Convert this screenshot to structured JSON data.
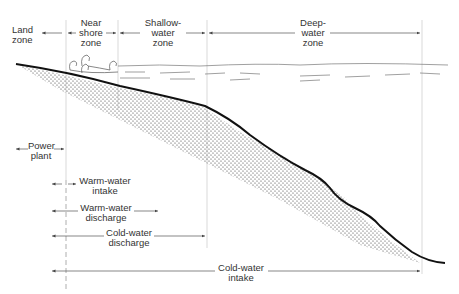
{
  "zones": {
    "land": {
      "line1": "Land",
      "line2": "zone"
    },
    "nearshore": {
      "line1": "Near",
      "line2": "shore",
      "line3": "zone"
    },
    "shallow": {
      "line1": "Shallow-",
      "line2": "water",
      "line3": "zone"
    },
    "deep": {
      "line1": "Deep-",
      "line2": "water",
      "line3": "zone"
    }
  },
  "ranges": {
    "power_plant": {
      "line1": "Power",
      "line2": "plant"
    },
    "warm_intake": {
      "line1": "Warm-water",
      "line2": "intake"
    },
    "warm_discharge": {
      "line1": "Warm-water",
      "line2": "discharge"
    },
    "cold_discharge": {
      "line1": "Cold-water",
      "line2": "discharge"
    },
    "cold_intake": {
      "line1": "Cold-water",
      "line2": "intake"
    }
  },
  "colors": {
    "line": "#111111",
    "guide": "#bbbbbb",
    "arrow": "#555555",
    "text": "#333333"
  }
}
